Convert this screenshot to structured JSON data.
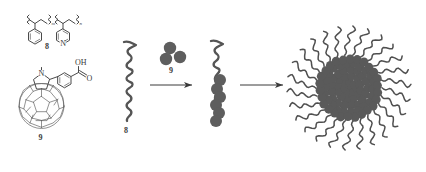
{
  "figure": {
    "kind": "reaction-scheme",
    "background_color": "#ffffff",
    "ink_color": "#4a4a4a",
    "sphere_color": "#5e5e5e"
  },
  "structures": {
    "polymer": {
      "label": "8",
      "name": "poly(styrene-co-4-vinylpyridine)",
      "repeat_units": [
        "m",
        "n"
      ],
      "heteroatom": "N"
    },
    "fullerene_derivative": {
      "label": "9",
      "name": "N-methyl-2-(4-carboxyphenyl)fulleropyrrolidine",
      "atoms": [
        "N",
        "OH",
        "O"
      ],
      "cage": "C60"
    }
  },
  "schematics": {
    "polymer_chain": {
      "label": "8",
      "name": "coiled-polymer-chain"
    },
    "fullerene_dots": {
      "label": "9",
      "name": "fullerene-particles",
      "count": 3
    },
    "complex": {
      "label": "",
      "name": "polymer-fullerene-complex",
      "bead_count": 6
    },
    "micelle": {
      "label": "",
      "name": "fullerene-core-micelle",
      "corona_arms": 26
    }
  },
  "arrows": [
    {
      "name": "arrow-1",
      "label": ""
    },
    {
      "name": "arrow-2",
      "label": ""
    }
  ]
}
